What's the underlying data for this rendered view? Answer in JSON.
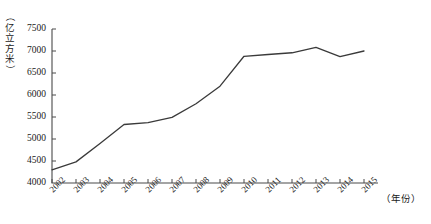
{
  "chart_data": {
    "type": "line",
    "title": "",
    "subtitle": "",
    "xlabel": "（年份）",
    "ylabel": "（亿立方米）",
    "categories": [
      "2002",
      "2003",
      "2004",
      "2005",
      "2006",
      "2007",
      "2008",
      "2009",
      "2010",
      "2011",
      "2012",
      "2013",
      "2014",
      "2015"
    ],
    "values": [
      4300,
      4480,
      4900,
      5330,
      5370,
      5490,
      5800,
      6200,
      6880,
      6920,
      6960,
      7080,
      6870,
      7000
    ],
    "series": [
      {
        "name": "用水量",
        "values": [
          4300,
          4480,
          4900,
          5330,
          5370,
          5490,
          5800,
          6200,
          6880,
          6920,
          6960,
          7080,
          6870,
          7000
        ]
      }
    ],
    "x": [
      "2002",
      "2003",
      "2004",
      "2005",
      "2006",
      "2007",
      "2008",
      "2009",
      "2010",
      "2011",
      "2012",
      "2013",
      "2014",
      "2015"
    ],
    "xlim": [
      2002,
      2015
    ],
    "ylim": [
      4000,
      7500
    ],
    "y_ticks": [
      4000,
      4500,
      5000,
      5500,
      6000,
      6500,
      7000,
      7500
    ],
    "y_tick_labels": [
      "4000",
      "4500",
      "5000",
      "5500",
      "6000",
      "6500",
      "7000",
      "7500"
    ],
    "x_tick_labels": [
      "2002",
      "2003",
      "2004",
      "2005",
      "2006",
      "2007",
      "2008",
      "2009",
      "2010",
      "2011",
      "2012",
      "2013",
      "2014",
      "2015"
    ],
    "grid": false,
    "legend": null,
    "legend_position": "none",
    "line_color": "#3a3a3a",
    "axis_color": "#4a4a4a",
    "annotations": []
  },
  "axis": {
    "y_unit_chars": [
      "（",
      "亿",
      "立",
      "方",
      "米",
      "）"
    ],
    "x_unit_text": "（年份）"
  }
}
